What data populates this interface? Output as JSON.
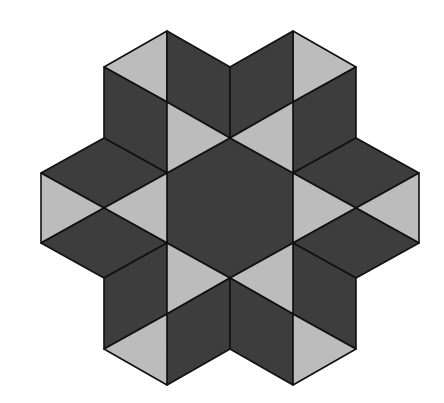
{
  "figure": {
    "width": 444,
    "height": 403,
    "colors": {
      "dark": "#3d3d3d",
      "light": "#bcbcbc",
      "stroke": "#111111",
      "background": "#ffffff"
    },
    "shapes": [
      {
        "name": "center-hexagon",
        "fill": "dark",
        "points": [
          [
            230,
            138
          ],
          [
            293,
            173
          ],
          [
            293,
            243
          ],
          [
            230,
            278
          ],
          [
            167,
            243
          ],
          [
            167,
            173
          ]
        ]
      },
      {
        "name": "top-left-light-triangle-outer",
        "fill": "light",
        "points": [
          [
            104,
            67
          ],
          [
            167,
            31
          ],
          [
            167,
            102
          ]
        ]
      },
      {
        "name": "top-left-dark-rhombus-upper",
        "fill": "dark",
        "points": [
          [
            167,
            31
          ],
          [
            230,
            67
          ],
          [
            230,
            138
          ],
          [
            167,
            102
          ]
        ]
      },
      {
        "name": "top-left-dark-rhombus-lower",
        "fill": "dark",
        "points": [
          [
            104,
            67
          ],
          [
            167,
            102
          ],
          [
            167,
            173
          ],
          [
            104,
            138
          ]
        ]
      },
      {
        "name": "top-left-light-triangle-inner",
        "fill": "light",
        "points": [
          [
            167,
            102
          ],
          [
            230,
            138
          ],
          [
            167,
            173
          ]
        ]
      },
      {
        "name": "top-right-light-triangle-outer",
        "fill": "light",
        "points": [
          [
            293,
            31
          ],
          [
            356,
            67
          ],
          [
            293,
            102
          ]
        ]
      },
      {
        "name": "top-right-dark-rhombus-upper",
        "fill": "dark",
        "points": [
          [
            230,
            67
          ],
          [
            293,
            31
          ],
          [
            293,
            102
          ],
          [
            230,
            138
          ]
        ]
      },
      {
        "name": "top-right-dark-rhombus-lower",
        "fill": "dark",
        "points": [
          [
            293,
            102
          ],
          [
            356,
            67
          ],
          [
            356,
            138
          ],
          [
            293,
            173
          ]
        ]
      },
      {
        "name": "top-right-light-triangle-inner",
        "fill": "light",
        "points": [
          [
            230,
            138
          ],
          [
            293,
            102
          ],
          [
            293,
            173
          ]
        ]
      },
      {
        "name": "left-dark-rhombus-upper",
        "fill": "dark",
        "points": [
          [
            41,
            173
          ],
          [
            104,
            138
          ],
          [
            167,
            173
          ],
          [
            104,
            208
          ]
        ]
      },
      {
        "name": "left-light-triangle-outer",
        "fill": "light",
        "points": [
          [
            41,
            173
          ],
          [
            104,
            208
          ],
          [
            41,
            243
          ]
        ]
      },
      {
        "name": "left-light-triangle-inner",
        "fill": "light",
        "points": [
          [
            104,
            208
          ],
          [
            167,
            173
          ],
          [
            167,
            243
          ]
        ]
      },
      {
        "name": "left-dark-rhombus-lower",
        "fill": "dark",
        "points": [
          [
            41,
            243
          ],
          [
            104,
            208
          ],
          [
            167,
            243
          ],
          [
            104,
            278
          ]
        ]
      },
      {
        "name": "right-dark-rhombus-upper",
        "fill": "dark",
        "points": [
          [
            293,
            173
          ],
          [
            356,
            138
          ],
          [
            419,
            173
          ],
          [
            356,
            208
          ]
        ]
      },
      {
        "name": "right-light-triangle-outer",
        "fill": "light",
        "points": [
          [
            419,
            173
          ],
          [
            419,
            243
          ],
          [
            356,
            208
          ]
        ]
      },
      {
        "name": "right-light-triangle-inner",
        "fill": "light",
        "points": [
          [
            293,
            173
          ],
          [
            356,
            208
          ],
          [
            293,
            243
          ]
        ]
      },
      {
        "name": "right-dark-rhombus-lower",
        "fill": "dark",
        "points": [
          [
            293,
            243
          ],
          [
            356,
            208
          ],
          [
            419,
            243
          ],
          [
            356,
            278
          ]
        ]
      },
      {
        "name": "bottom-left-dark-rhombus-upper",
        "fill": "dark",
        "points": [
          [
            104,
            278
          ],
          [
            167,
            243
          ],
          [
            167,
            314
          ],
          [
            104,
            349
          ]
        ]
      },
      {
        "name": "bottom-left-light-triangle-inner",
        "fill": "light",
        "points": [
          [
            167,
            243
          ],
          [
            230,
            278
          ],
          [
            167,
            314
          ]
        ]
      },
      {
        "name": "bottom-left-dark-rhombus-lower",
        "fill": "dark",
        "points": [
          [
            167,
            314
          ],
          [
            230,
            278
          ],
          [
            230,
            349
          ],
          [
            167,
            385
          ]
        ]
      },
      {
        "name": "bottom-left-light-triangle-outer",
        "fill": "light",
        "points": [
          [
            104,
            349
          ],
          [
            167,
            314
          ],
          [
            167,
            385
          ]
        ]
      },
      {
        "name": "bottom-right-dark-rhombus-upper",
        "fill": "dark",
        "points": [
          [
            293,
            243
          ],
          [
            356,
            278
          ],
          [
            356,
            349
          ],
          [
            293,
            314
          ]
        ]
      },
      {
        "name": "bottom-right-light-triangle-inner",
        "fill": "light",
        "points": [
          [
            230,
            278
          ],
          [
            293,
            243
          ],
          [
            293,
            314
          ]
        ]
      },
      {
        "name": "bottom-right-dark-rhombus-lower",
        "fill": "dark",
        "points": [
          [
            230,
            278
          ],
          [
            293,
            314
          ],
          [
            293,
            385
          ],
          [
            230,
            349
          ]
        ]
      },
      {
        "name": "bottom-right-light-triangle-outer",
        "fill": "light",
        "points": [
          [
            293,
            314
          ],
          [
            356,
            349
          ],
          [
            293,
            385
          ]
        ]
      }
    ]
  }
}
